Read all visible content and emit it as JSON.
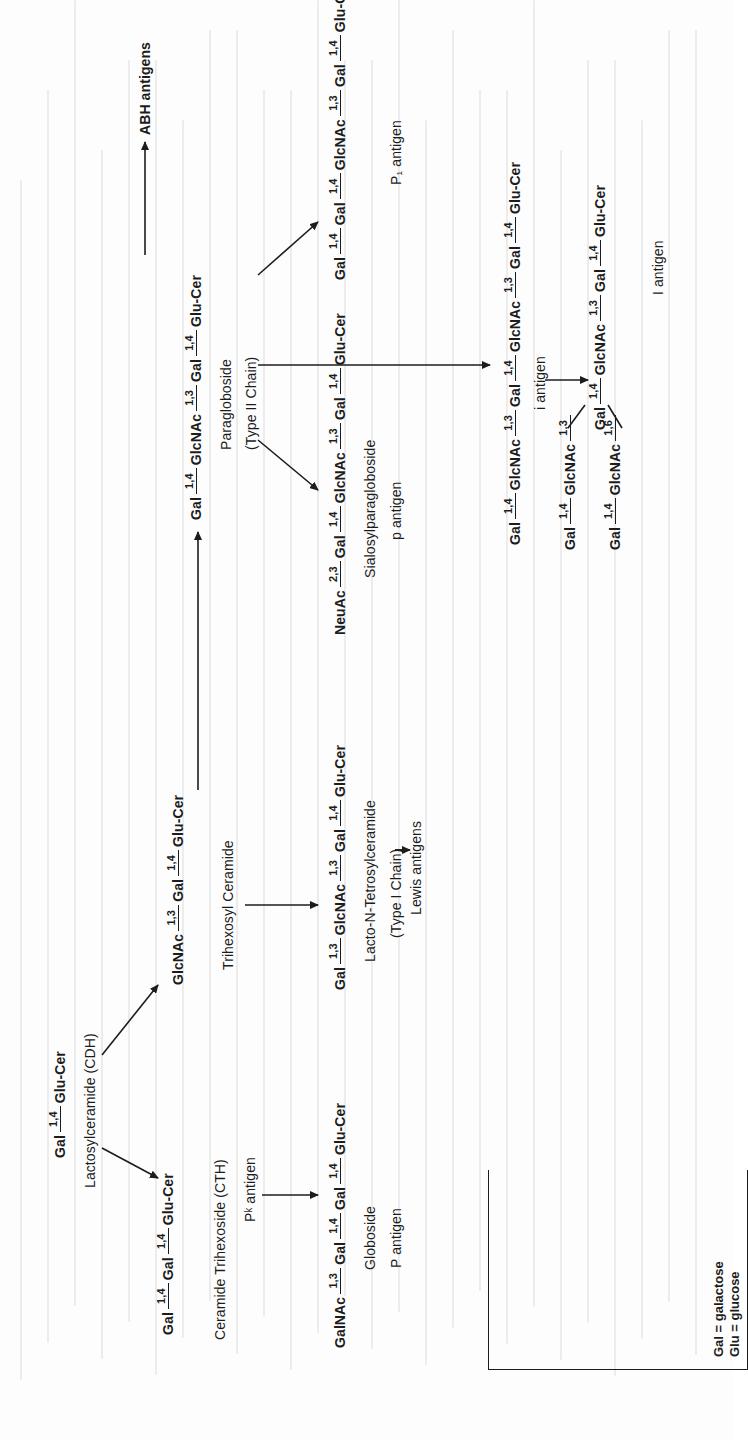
{
  "figure": {
    "orientation": "rotated-90-ccw",
    "nodes": {
      "lactosyl": {
        "chain": [
          "Gal",
          "1,4",
          "Glu-Cer"
        ],
        "name": "Lactosylceramide (CDH)"
      },
      "cth": {
        "chain": [
          "Gal",
          "1,4",
          "Gal",
          "1,4",
          "Glu-Cer"
        ],
        "name": "Ceramide Trihexoside (CTH)",
        "antigen": "Pᵏ antigen"
      },
      "globoside": {
        "chain": [
          "GalNAc",
          "1,3",
          "Gal",
          "1,4",
          "Gal",
          "1,4",
          "Glu-Cer"
        ],
        "name": "Globoside",
        "antigen": "P antigen"
      },
      "trihexosyl": {
        "chain": [
          "GlcNAc",
          "1,3",
          "Gal",
          "1,4",
          "Glu-Cer"
        ],
        "name": "Trihexosyl Ceramide"
      },
      "lacto_n": {
        "chain": [
          "Gal",
          "1,3",
          "GlcNAc",
          "1,3",
          "Gal",
          "1,4",
          "Glu-Cer"
        ],
        "name": "Lacto-N-Tetrosylceramide",
        "type": "(Type I Chain)",
        "product": "Lewis antigens"
      },
      "paragloboside": {
        "chain": [
          "Gal",
          "1,4",
          "GlcNAc",
          "1,3",
          "Gal",
          "1,4",
          "Glu-Cer"
        ],
        "name": "Paragloboside",
        "type": "(Type II Chain)",
        "product": "ABH antigens"
      },
      "sialosyl": {
        "chain": [
          "NeuAc",
          "2,3",
          "Gal",
          "1,4",
          "GlcNAc",
          "1,3",
          "Gal",
          "1,4",
          "Glu-Cer"
        ],
        "name": "Sialosylparagloboside",
        "antigen": "p antigen"
      },
      "p1": {
        "chain": [
          "Gal",
          "1,4",
          "Gal",
          "1,4",
          "GlcNAc",
          "1,3",
          "Gal",
          "1,4",
          "Glu-Cer"
        ],
        "antigen": "P₁ antigen"
      },
      "i_antigen": {
        "chain": [
          "Gal",
          "1,4",
          "GlcNAc",
          "1,3",
          "Gal",
          "1,4",
          "GlcNAc",
          "1,3",
          "Gal",
          "1,4",
          "Glu-Cer"
        ],
        "antigen": "i antigen"
      },
      "I_antigen": {
        "core": [
          "Gal",
          "1,4",
          "GlcNAc",
          "1,3",
          "Gal",
          "1,4",
          "Glu-Cer"
        ],
        "branch_a": [
          "Gal",
          "1,4",
          "GlcNAc",
          "1,3"
        ],
        "branch_b": [
          "Gal",
          "1,4",
          "GlcNAc",
          "1,6"
        ],
        "antigen": "I antigen"
      }
    },
    "legend": {
      "rows": [
        "Gal = galactose",
        "Glu = glucose"
      ]
    }
  }
}
